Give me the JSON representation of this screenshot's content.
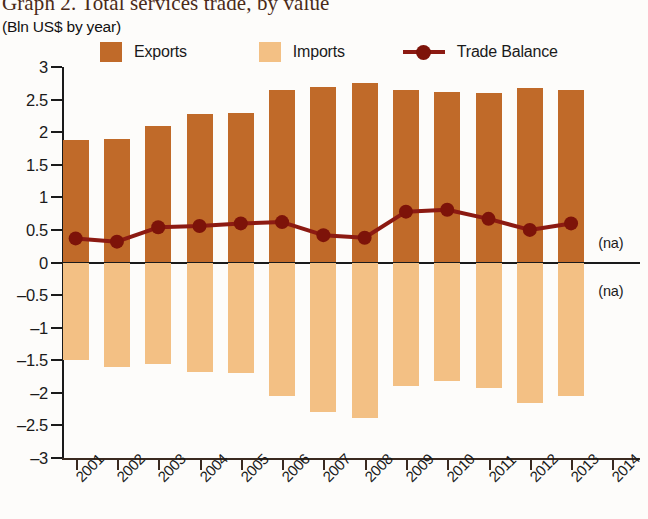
{
  "chart_data": {
    "type": "bar",
    "title": "Graph 2. Total services trade, by value",
    "subtitle": "(Bln US$ by year)",
    "xlabel": "",
    "ylabel": "",
    "ylim": [
      -3,
      3
    ],
    "grid": false,
    "legend_position": "top",
    "categories": [
      "2001",
      "2002",
      "2003",
      "2004",
      "2005",
      "2006",
      "2007",
      "2008",
      "2009",
      "2010",
      "2011",
      "2012",
      "2013",
      "2014"
    ],
    "ytick_labels": [
      "3",
      "2.5",
      "2",
      "1.5",
      "1",
      "0.5",
      "0",
      "–0.5",
      "–1",
      "–1.5",
      "–2",
      "–2.5",
      "–3"
    ],
    "ytick_values": [
      3,
      2.5,
      2,
      1.5,
      1,
      0.5,
      0,
      -0.5,
      -1,
      -1.5,
      -2,
      -2.5,
      -3
    ],
    "series": [
      {
        "name": "Exports",
        "type": "bar",
        "color": "#c06a29",
        "values": [
          1.88,
          1.9,
          2.1,
          2.28,
          2.3,
          2.65,
          2.7,
          2.75,
          2.65,
          2.62,
          2.6,
          2.68,
          2.65,
          null
        ]
      },
      {
        "name": "Imports",
        "type": "bar",
        "color": "#f3c084",
        "values": [
          -1.5,
          -1.6,
          -1.55,
          -1.68,
          -1.7,
          -2.05,
          -2.3,
          -2.38,
          -1.9,
          -1.82,
          -1.92,
          -2.15,
          -2.05,
          null
        ]
      },
      {
        "name": "Trade Balance",
        "type": "line",
        "color": "#8c1a12",
        "values": [
          0.37,
          0.32,
          0.54,
          0.56,
          0.6,
          0.62,
          0.42,
          0.38,
          0.78,
          0.81,
          0.67,
          0.5,
          0.6,
          null
        ]
      }
    ],
    "annotations": [
      {
        "text": "(na)",
        "x": "2014",
        "y": 0.28
      },
      {
        "text": "(na)",
        "x": "2014",
        "y": -0.45
      }
    ]
  },
  "legend": {
    "exports_label": "Exports",
    "imports_label": "Imports",
    "balance_label": "Trade Balance"
  },
  "colors": {
    "exports": "#c06a29",
    "imports": "#f3c084",
    "balance": "#8c1a12",
    "axis": "#1a1a1a",
    "title": "#4a2a18"
  }
}
